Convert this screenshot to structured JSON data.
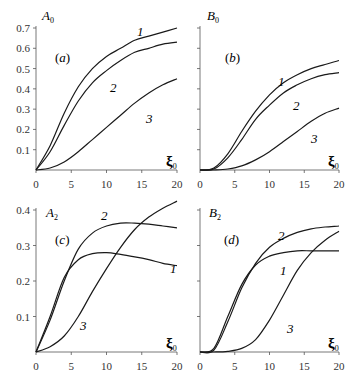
{
  "chart_data": [
    {
      "panel": "(a)",
      "type": "line",
      "ylabel": "A0",
      "xlabel": "ξ0",
      "xlim": [
        0,
        20
      ],
      "ylim": [
        0,
        0.7
      ],
      "xticks": [
        0,
        5,
        10,
        15,
        20
      ],
      "yticks": [
        0.1,
        0.2,
        0.3,
        0.4,
        0.5,
        0.6,
        0.7
      ],
      "grid": false,
      "x": [
        0,
        2,
        4,
        6,
        8,
        10,
        12,
        14,
        16,
        18,
        20
      ],
      "series": [
        {
          "name": "1",
          "values": [
            0,
            0.12,
            0.28,
            0.41,
            0.5,
            0.56,
            0.6,
            0.64,
            0.66,
            0.68,
            0.7
          ]
        },
        {
          "name": "2",
          "values": [
            0,
            0.09,
            0.22,
            0.34,
            0.43,
            0.49,
            0.54,
            0.58,
            0.6,
            0.62,
            0.63
          ]
        },
        {
          "name": "3",
          "values": [
            0,
            0.01,
            0.04,
            0.09,
            0.15,
            0.21,
            0.27,
            0.33,
            0.38,
            0.42,
            0.45
          ]
        }
      ]
    },
    {
      "panel": "(b)",
      "type": "line",
      "ylabel": "B0",
      "xlabel": "ξ0",
      "xlim": [
        0,
        20
      ],
      "ylim": [
        0,
        0.7
      ],
      "xticks": [
        0,
        5,
        10,
        15,
        20
      ],
      "grid": false,
      "x": [
        0,
        2,
        4,
        6,
        8,
        10,
        12,
        14,
        16,
        18,
        20
      ],
      "series": [
        {
          "name": "1",
          "values": [
            0,
            0.01,
            0.08,
            0.19,
            0.29,
            0.37,
            0.43,
            0.47,
            0.5,
            0.52,
            0.54
          ]
        },
        {
          "name": "2",
          "values": [
            0,
            0.005,
            0.06,
            0.15,
            0.25,
            0.32,
            0.38,
            0.42,
            0.45,
            0.47,
            0.48
          ]
        },
        {
          "name": "3",
          "values": [
            0,
            0,
            0.005,
            0.02,
            0.05,
            0.09,
            0.14,
            0.19,
            0.24,
            0.28,
            0.305
          ]
        }
      ]
    },
    {
      "panel": "(c)",
      "type": "line",
      "ylabel": "A2",
      "xlabel": "ξ0",
      "xlim": [
        0,
        20
      ],
      "ylim": [
        0,
        0.4
      ],
      "xticks": [
        0,
        5,
        10,
        15,
        20
      ],
      "yticks": [
        0.1,
        0.2,
        0.3,
        0.4
      ],
      "grid": false,
      "x": [
        0,
        2,
        4,
        6,
        8,
        10,
        12,
        14,
        16,
        18,
        20
      ],
      "series": [
        {
          "name": "1",
          "values": [
            0,
            0.1,
            0.21,
            0.26,
            0.277,
            0.28,
            0.275,
            0.268,
            0.26,
            0.25,
            0.243
          ]
        },
        {
          "name": "2",
          "values": [
            0,
            0.09,
            0.2,
            0.29,
            0.335,
            0.355,
            0.363,
            0.363,
            0.36,
            0.355,
            0.35
          ]
        },
        {
          "name": "3",
          "values": [
            0,
            0.015,
            0.045,
            0.1,
            0.17,
            0.235,
            0.295,
            0.345,
            0.38,
            0.405,
            0.425
          ]
        }
      ]
    },
    {
      "panel": "(d)",
      "type": "line",
      "ylabel": "B2",
      "xlabel": "ξ0",
      "xlim": [
        0,
        20
      ],
      "ylim": [
        0,
        0.4
      ],
      "xticks": [
        0,
        5,
        10,
        15,
        20
      ],
      "grid": false,
      "x": [
        0,
        2,
        4,
        6,
        8,
        10,
        12,
        14,
        16,
        18,
        20
      ],
      "series": [
        {
          "name": "1",
          "values": [
            0,
            0.01,
            0.1,
            0.19,
            0.245,
            0.27,
            0.28,
            0.285,
            0.285,
            0.285,
            0.285
          ]
        },
        {
          "name": "2",
          "values": [
            0,
            0.005,
            0.085,
            0.18,
            0.25,
            0.295,
            0.32,
            0.337,
            0.347,
            0.352,
            0.355
          ]
        },
        {
          "name": "3",
          "values": [
            0,
            0,
            0.002,
            0.01,
            0.035,
            0.09,
            0.16,
            0.23,
            0.28,
            0.315,
            0.34
          ]
        }
      ]
    }
  ],
  "panels": [
    {
      "id": "a",
      "tag": "(a)",
      "ylabel_main": "A",
      "ylabel_sub": "0",
      "xlabel_main": "ξ",
      "xlabel_sub": "0",
      "x0": 36,
      "x1": 177,
      "y0": 170,
      "yTop": 28,
      "ymax": 0.7,
      "yticks": [
        "0.1",
        "0.2",
        "0.3",
        "0.4",
        "0.5",
        "0.6",
        "0.7"
      ],
      "show_ytick_labels": true,
      "xticks": [
        "0",
        "5",
        "10",
        "15",
        "20"
      ],
      "tag_pos": [
        55,
        62
      ],
      "ylabel_pos": [
        42,
        20
      ],
      "xlabel_pos": [
        166,
        166
      ],
      "curve_labels": [
        {
          "text": "1",
          "x": 137,
          "y": 36
        },
        {
          "text": "2",
          "x": 110,
          "y": 92
        },
        {
          "text": "3",
          "x": 146,
          "y": 123
        }
      ]
    },
    {
      "id": "b",
      "tag": "(b)",
      "ylabel_main": "B",
      "ylabel_sub": "0",
      "xlabel_main": "ξ",
      "xlabel_sub": "0",
      "x0": 200,
      "x1": 339,
      "y0": 170,
      "yTop": 28,
      "ymax": 0.7,
      "yticks": [
        "0.1",
        "0.2",
        "0.3",
        "0.4",
        "0.5",
        "0.6",
        "0.7"
      ],
      "show_ytick_labels": false,
      "xticks": [
        "0",
        "5",
        "10",
        "15",
        "20"
      ],
      "tag_pos": [
        225,
        62
      ],
      "ylabel_pos": [
        207,
        20
      ],
      "xlabel_pos": [
        328,
        166
      ],
      "curve_labels": [
        {
          "text": "1",
          "x": 278,
          "y": 86
        },
        {
          "text": "2",
          "x": 293,
          "y": 110
        },
        {
          "text": "3",
          "x": 311,
          "y": 143
        }
      ]
    },
    {
      "id": "c",
      "tag": "(c)",
      "ylabel_main": "A",
      "ylabel_sub": "2",
      "xlabel_main": "ξ",
      "xlabel_sub": "0",
      "x0": 36,
      "x1": 177,
      "y0": 352,
      "yTop": 210,
      "ymax": 0.4,
      "yticks": [
        "0.1",
        "0.2",
        "0.3",
        "0.4"
      ],
      "show_ytick_labels": true,
      "xticks": [
        "0",
        "5",
        "10",
        "15",
        "20"
      ],
      "tag_pos": [
        55,
        244
      ],
      "ylabel_pos": [
        46,
        217
      ],
      "xlabel_pos": [
        166,
        348
      ],
      "curve_labels": [
        {
          "text": "2",
          "x": 101,
          "y": 220
        },
        {
          "text": "1",
          "x": 170,
          "y": 273
        },
        {
          "text": "3",
          "x": 80,
          "y": 330
        }
      ]
    },
    {
      "id": "d",
      "tag": "(d)",
      "ylabel_main": "B",
      "ylabel_sub": "2",
      "xlabel_main": "ξ",
      "xlabel_sub": "0",
      "x0": 200,
      "x1": 339,
      "y0": 352,
      "yTop": 210,
      "ymax": 0.4,
      "yticks": [
        "0.1",
        "0.2",
        "0.3",
        "0.4"
      ],
      "show_ytick_labels": false,
      "xticks": [
        "0",
        "5",
        "10",
        "15",
        "20"
      ],
      "tag_pos": [
        224,
        244
      ],
      "ylabel_pos": [
        209,
        217
      ],
      "xlabel_pos": [
        328,
        348
      ],
      "curve_labels": [
        {
          "text": "2",
          "x": 278,
          "y": 240
        },
        {
          "text": "1",
          "x": 280,
          "y": 275
        },
        {
          "text": "3",
          "x": 287,
          "y": 333
        }
      ]
    }
  ]
}
